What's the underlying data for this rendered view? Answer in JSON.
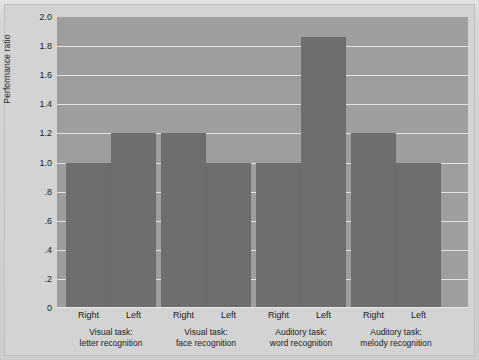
{
  "chart_data": {
    "type": "bar",
    "title": "",
    "subtitle": "",
    "xlabel": "",
    "ylabel": "Performance ratio",
    "ylim": [
      0,
      2.0
    ],
    "grid": true,
    "legend": "none",
    "yticks": [
      "2.0",
      "1.8",
      "1.6",
      "1.4",
      "1.2",
      "1.0",
      ".8",
      ".6",
      ".4",
      ".2",
      "0"
    ],
    "ytick_values": [
      2.0,
      1.8,
      1.6,
      1.4,
      1.2,
      1.0,
      0.8,
      0.6,
      0.4,
      0.2,
      0
    ],
    "categories": [
      "Visual task: letter recognition",
      "Visual task: face recognition",
      "Auditory task: word recognition",
      "Auditory task: melody recognition"
    ],
    "group_labels": [
      {
        "line1": "Visual task:",
        "line2": "letter recognition"
      },
      {
        "line1": "Visual task:",
        "line2": "face recognition"
      },
      {
        "line1": "Auditory task:",
        "line2": "word recognition"
      },
      {
        "line1": "Auditory task:",
        "line2": "melody recognition"
      }
    ],
    "series": [
      {
        "name": "Right",
        "values": [
          1.0,
          1.2,
          1.0,
          1.2
        ]
      },
      {
        "name": "Left",
        "values": [
          1.2,
          1.0,
          1.86,
          1.0
        ]
      }
    ],
    "bars": [
      {
        "group": 0,
        "ear": "Right",
        "value": 1.0
      },
      {
        "group": 0,
        "ear": "Left",
        "value": 1.2
      },
      {
        "group": 1,
        "ear": "Right",
        "value": 1.2
      },
      {
        "group": 1,
        "ear": "Left",
        "value": 1.0
      },
      {
        "group": 2,
        "ear": "Right",
        "value": 1.0
      },
      {
        "group": 2,
        "ear": "Left",
        "value": 1.86
      },
      {
        "group": 3,
        "ear": "Right",
        "value": 1.2
      },
      {
        "group": 3,
        "ear": "Left",
        "value": 1.0
      }
    ],
    "colors": {
      "bar": "#6e6e6e",
      "plot_background": "#9e9e9e",
      "figure_background": "#d3d3d3",
      "gridline": "#efefef",
      "text": "#222222"
    }
  }
}
